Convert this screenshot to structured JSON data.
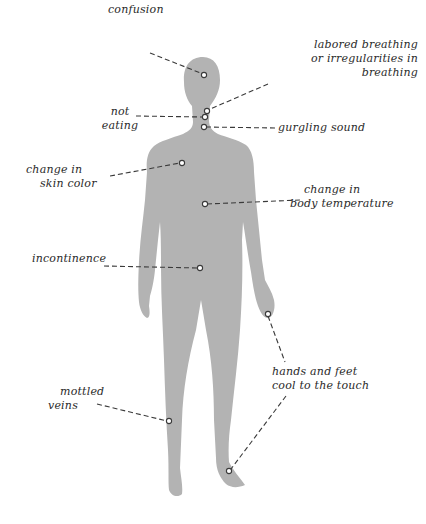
{
  "diagram": {
    "colors": {
      "background": "#ffffff",
      "silhouette": "#b3b3b3",
      "leader_line": "#3a3a3a",
      "marker_fill": "#ffffff",
      "marker_stroke": "#3a3a3a",
      "text": "#2a2a2a"
    },
    "labels": [
      {
        "id": "confusion",
        "lines": [
          "confusion"
        ],
        "marker": [
          204,
          75
        ]
      },
      {
        "id": "labored-breathing",
        "lines": [
          "labored breathing",
          "or irregularities in",
          "breathing"
        ],
        "marker": [
          207,
          111
        ]
      },
      {
        "id": "not-eating",
        "lines": [
          "not",
          "eating"
        ],
        "marker": [
          205,
          117
        ]
      },
      {
        "id": "gurgling-sound",
        "lines": [
          "gurgling sound"
        ],
        "marker": [
          204,
          127
        ]
      },
      {
        "id": "skin-color",
        "lines": [
          "change in",
          "skin color"
        ],
        "marker": [
          182,
          163
        ]
      },
      {
        "id": "body-temperature",
        "lines": [
          "change in",
          "body temperature"
        ],
        "marker": [
          205,
          204
        ]
      },
      {
        "id": "incontinence",
        "lines": [
          "incontinence"
        ],
        "marker": [
          200,
          268
        ]
      },
      {
        "id": "hands-feet",
        "lines": [
          "hands and feet",
          "cool to the touch"
        ],
        "marker": [
          268,
          314
        ]
      },
      {
        "id": "mottled-veins",
        "lines": [
          "mottled",
          "veins"
        ],
        "marker": [
          169,
          421
        ]
      }
    ],
    "extra_marker": {
      "id": "foot-marker",
      "marker": [
        229,
        471
      ]
    }
  }
}
